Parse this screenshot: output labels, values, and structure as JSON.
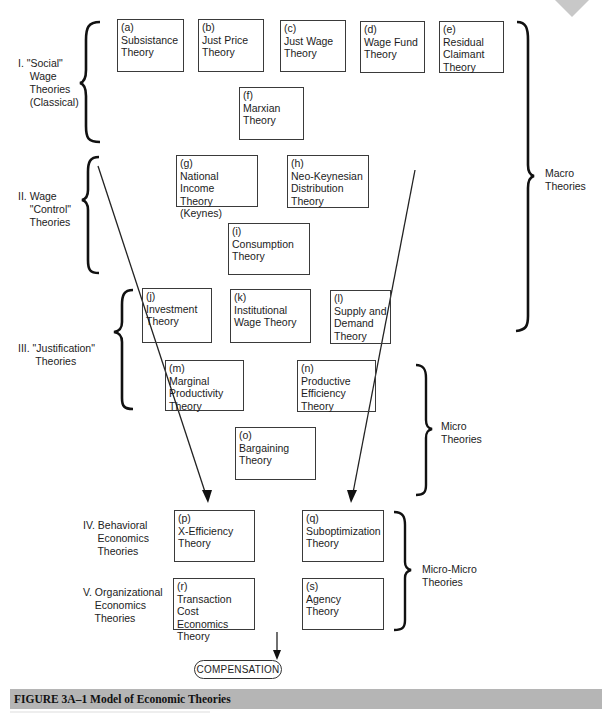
{
  "figure": {
    "caption": "FIGURE 3A–1  Model of Economic Theories",
    "terminal_node": "COMPENSATION"
  },
  "groups": [
    {
      "id": "I",
      "label": "I. \"Social\"\n    Wage\n    Theories\n    (Classical)"
    },
    {
      "id": "II",
      "label": "II. Wage\n    \"Control\"\n    Theories"
    },
    {
      "id": "III",
      "label": "III. \"Justification\"\n      Theories"
    },
    {
      "id": "IV",
      "label": "IV. Behavioral\n     Economics\n     Theories"
    },
    {
      "id": "V",
      "label": "V. Organizational\n    Economics\n    Theories"
    }
  ],
  "scopes": [
    {
      "id": "macro",
      "label": "Macro\nTheories"
    },
    {
      "id": "micro",
      "label": "Micro\nTheories"
    },
    {
      "id": "micro_micro",
      "label": "Micro-Micro\nTheories"
    }
  ],
  "theories": [
    {
      "key": "(a)",
      "name": "Subsistance\nTheory"
    },
    {
      "key": "(b)",
      "name": "Just Price\nTheory"
    },
    {
      "key": "(c)",
      "name": "Just Wage\nTheory"
    },
    {
      "key": "(d)",
      "name": "Wage Fund\nTheory"
    },
    {
      "key": "(e)",
      "name": "Residual\nClaimant\nTheory"
    },
    {
      "key": "(f)",
      "name": "Marxian\nTheory"
    },
    {
      "key": "(g)",
      "name": "National Income\nTheory (Keynes)"
    },
    {
      "key": "(h)",
      "name": "Neo-Keynesian\nDistribution\nTheory"
    },
    {
      "key": "(i)",
      "name": "Consumption\nTheory"
    },
    {
      "key": "(j)",
      "name": "Investment\nTheory"
    },
    {
      "key": "(k)",
      "name": "Institutional\nWage Theory"
    },
    {
      "key": "(l)",
      "name": "Supply and\nDemand\nTheory"
    },
    {
      "key": "(m)",
      "name": "Marginal\nProductivity\nTheory"
    },
    {
      "key": "(n)",
      "name": "Productive\nEfficiency\nTheory"
    },
    {
      "key": "(o)",
      "name": "Bargaining\nTheory"
    },
    {
      "key": "(p)",
      "name": "X-Efficiency\nTheory"
    },
    {
      "key": "(q)",
      "name": "Suboptimization\nTheory"
    },
    {
      "key": "(r)",
      "name": "Transaction\nCost Economics\nTheory"
    },
    {
      "key": "(s)",
      "name": "Agency\nTheory"
    }
  ]
}
